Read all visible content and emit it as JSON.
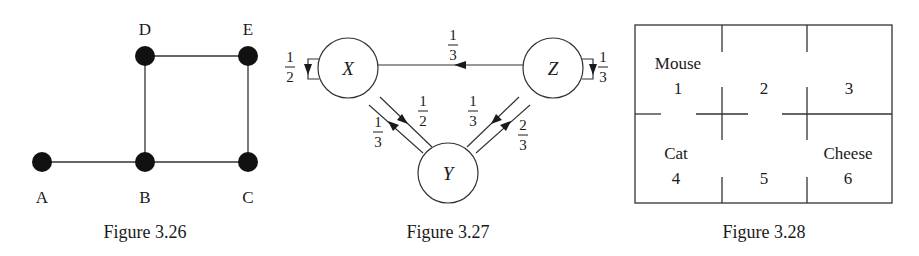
{
  "figures": [
    {
      "id": "fig326",
      "caption": "Figure 3.26",
      "type": "undirected-graph",
      "nodes": [
        {
          "label": "A",
          "x": 42,
          "y": 162
        },
        {
          "label": "B",
          "x": 145,
          "y": 162
        },
        {
          "label": "C",
          "x": 248,
          "y": 162
        },
        {
          "label": "D",
          "x": 145,
          "y": 56
        },
        {
          "label": "E",
          "x": 248,
          "y": 56
        }
      ],
      "edges": [
        [
          "A",
          "B"
        ],
        [
          "B",
          "C"
        ],
        [
          "B",
          "D"
        ],
        [
          "D",
          "E"
        ],
        [
          "E",
          "C"
        ]
      ]
    },
    {
      "id": "fig327",
      "caption": "Figure 3.27",
      "type": "markov-chain",
      "nodes": [
        {
          "label": "X",
          "x": 348,
          "y": 68
        },
        {
          "label": "Y",
          "x": 448,
          "y": 173
        },
        {
          "label": "Z",
          "x": 553,
          "y": 68
        }
      ],
      "transitions": [
        {
          "from": "X",
          "to": "X",
          "num": "1",
          "den": "2"
        },
        {
          "from": "X",
          "to": "Y",
          "num": "1",
          "den": "2"
        },
        {
          "from": "Y",
          "to": "X",
          "num": "1",
          "den": "3"
        },
        {
          "from": "Z",
          "to": "X",
          "num": "1",
          "den": "3"
        },
        {
          "from": "Z",
          "to": "Y",
          "num": "1",
          "den": "3"
        },
        {
          "from": "Y",
          "to": "Z",
          "num": "2",
          "den": "3"
        },
        {
          "from": "Z",
          "to": "Z",
          "num": "1",
          "den": "3"
        }
      ]
    },
    {
      "id": "fig328",
      "caption": "Figure 3.28",
      "type": "maze",
      "rooms": [
        {
          "number": "1",
          "name": "Mouse"
        },
        {
          "number": "2",
          "name": ""
        },
        {
          "number": "3",
          "name": ""
        },
        {
          "number": "4",
          "name": "Cat"
        },
        {
          "number": "5",
          "name": ""
        },
        {
          "number": "6",
          "name": "Cheese"
        }
      ]
    }
  ]
}
